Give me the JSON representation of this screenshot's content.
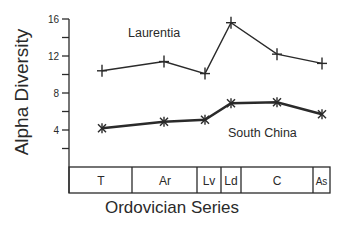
{
  "chart_data": {
    "type": "line",
    "title": "",
    "xlabel": "Ordovician Series",
    "ylabel": "Alpha Diversity",
    "ylim": [
      0,
      16
    ],
    "yticks": [
      4,
      8,
      12,
      16
    ],
    "yminor_ticks": [
      2,
      6,
      10,
      14
    ],
    "grid": false,
    "legend_position": "inline labels",
    "categories": [
      "T",
      "Ar",
      "Lv",
      "Ld",
      "C",
      "As"
    ],
    "category_spans_px": [
      [
        69,
        132
      ],
      [
        132,
        197
      ],
      [
        197,
        221
      ],
      [
        221,
        241
      ],
      [
        241,
        313
      ],
      [
        313,
        330
      ]
    ],
    "series": [
      {
        "name": "Laurentia",
        "marker": "+",
        "line_weight": "thin",
        "values": [
          10.4,
          11.4,
          10.1,
          15.6,
          12.2,
          11.2
        ]
      },
      {
        "name": "South China",
        "marker": "*",
        "line_weight": "thick",
        "values": [
          4.2,
          4.9,
          5.1,
          6.9,
          7.0,
          5.7
        ]
      }
    ],
    "annotations": [
      {
        "text": "Laurentia",
        "near_series": "Laurentia"
      },
      {
        "text": "South China",
        "near_series": "South China"
      }
    ]
  },
  "labels": {
    "ylabel": "Alpha Diversity",
    "xlabel": "Ordovician Series",
    "laurentia": "Laurentia",
    "south_china": "South China",
    "yticks": [
      "16",
      "12",
      "8",
      "4"
    ],
    "periods": [
      "T",
      "Ar",
      "Lv",
      "Ld",
      "C",
      "As"
    ]
  }
}
